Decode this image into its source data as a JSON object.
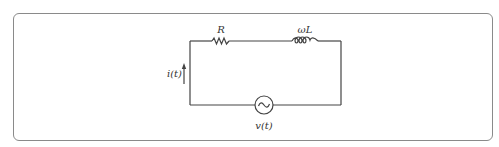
{
  "diagram": {
    "type": "series RL circuit with AC source",
    "components": [
      {
        "id": "resistor",
        "label": "R"
      },
      {
        "id": "inductor",
        "label": "ωL"
      },
      {
        "id": "ac-source",
        "label": "v(t)",
        "symbol": "~"
      }
    ],
    "current": {
      "label": "i(t)",
      "direction": "up"
    }
  },
  "colors": {
    "wire": "#444444",
    "border": "#8a8a8a",
    "text": "#333333"
  }
}
